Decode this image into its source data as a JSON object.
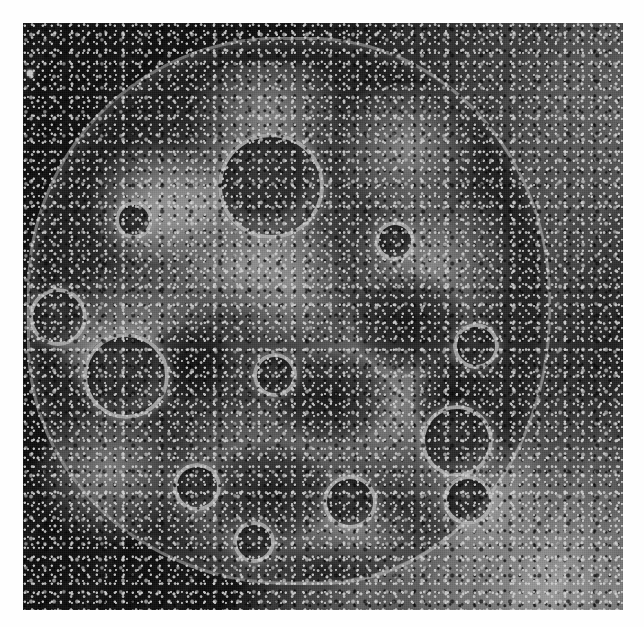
{
  "figure": {
    "domain_label": "Natural-Image",
    "kind": "scanning-electron-micrograph",
    "caption": "",
    "title": "",
    "scale_bar_label": "",
    "panel_label": "",
    "annotations": []
  },
  "plate": {
    "x": 23,
    "y": 23,
    "width": 600,
    "height": 587,
    "background_color": "#0e0e0e",
    "page_color": "#ffffff",
    "highlight_color": "#f0f0f0",
    "midtone_color": "#7a7a7a",
    "shadow_color": "#141414"
  },
  "marks": {
    "registration_dot": {
      "x": 4,
      "y": 47,
      "size": 6,
      "color": "#f2f2f2"
    }
  },
  "cell": {
    "center_x": 266,
    "center_y": 288,
    "width": 520,
    "height": 540,
    "body_tone": "#3a3a3a",
    "rim_tone": "#ededed",
    "blebs": [
      {
        "x": 195,
        "y": 110,
        "d": 106
      },
      {
        "x": 60,
        "y": 310,
        "d": 86
      },
      {
        "x": 6,
        "y": 265,
        "d": 58
      },
      {
        "x": 398,
        "y": 382,
        "d": 72
      },
      {
        "x": 430,
        "y": 300,
        "d": 46
      },
      {
        "x": 300,
        "y": 452,
        "d": 54
      },
      {
        "x": 150,
        "y": 440,
        "d": 48
      },
      {
        "x": 352,
        "y": 198,
        "d": 40
      },
      {
        "x": 230,
        "y": 330,
        "d": 44
      },
      {
        "x": 92,
        "y": 178,
        "d": 38
      },
      {
        "x": 420,
        "y": 452,
        "d": 50
      },
      {
        "x": 210,
        "y": 498,
        "d": 42
      }
    ],
    "crusts": [
      {
        "x": 150,
        "y": 38,
        "w": 190,
        "h": 110
      },
      {
        "x": 300,
        "y": 60,
        "w": 170,
        "h": 130
      },
      {
        "x": 30,
        "y": 240,
        "w": 160,
        "h": 150
      },
      {
        "x": 250,
        "y": 280,
        "w": 230,
        "h": 200
      },
      {
        "x": 120,
        "y": 380,
        "w": 230,
        "h": 180
      },
      {
        "x": 330,
        "y": 150,
        "w": 160,
        "h": 180
      },
      {
        "x": 60,
        "y": 120,
        "w": 140,
        "h": 120
      },
      {
        "x": 380,
        "y": 400,
        "w": 150,
        "h": 140
      },
      {
        "x": 200,
        "y": 200,
        "w": 130,
        "h": 120
      },
      {
        "x": 10,
        "y": 380,
        "w": 150,
        "h": 140
      }
    ],
    "ridges": [
      {
        "x": 70,
        "y": 120,
        "w": 210,
        "h": 130,
        "rot": -28
      },
      {
        "x": 120,
        "y": 200,
        "w": 190,
        "h": 90,
        "rot": -20
      },
      {
        "x": 20,
        "y": 300,
        "w": 120,
        "h": 70,
        "rot": 35
      },
      {
        "x": 250,
        "y": 470,
        "w": 170,
        "h": 80,
        "rot": 12
      }
    ],
    "pits": [
      {
        "x": 250,
        "y": 330,
        "w": 120,
        "h": 90
      },
      {
        "x": 120,
        "y": 300,
        "w": 90,
        "h": 80
      },
      {
        "x": 330,
        "y": 250,
        "w": 110,
        "h": 100
      },
      {
        "x": 180,
        "y": 420,
        "w": 130,
        "h": 100
      },
      {
        "x": 390,
        "y": 330,
        "w": 80,
        "h": 90
      }
    ]
  },
  "substrate": {
    "streak_angle_deg": 118,
    "bright_band_present": true,
    "lower_right_tone": "#b0b0b0",
    "upper_right_tone": "#6e6e6e"
  }
}
